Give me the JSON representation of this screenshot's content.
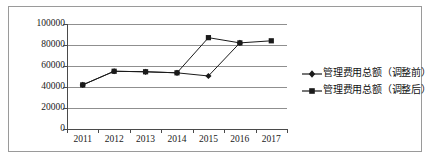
{
  "chart_data": {
    "type": "line",
    "title": "",
    "xlabel": "",
    "ylabel": "",
    "categories": [
      "2011",
      "2012",
      "2013",
      "2014",
      "2015",
      "2016",
      "2017"
    ],
    "ylim": [
      0,
      100000
    ],
    "ytick_labels": [
      "0",
      "20000",
      "40000",
      "60000",
      "80000",
      "100000"
    ],
    "ytick_values": [
      0,
      20000,
      40000,
      60000,
      80000,
      100000
    ],
    "grid": true,
    "legend_position": "right",
    "series": [
      {
        "name": "管理费用总额（调整前）",
        "marker": "diamond",
        "color": "#1a1a1a",
        "x": [
          "2011",
          "2012",
          "2013",
          "2014",
          "2015",
          "2016"
        ],
        "values": [
          42000,
          55000,
          54500,
          53500,
          50500,
          82000
        ]
      },
      {
        "name": "管理费用总额（调整后）",
        "marker": "square",
        "color": "#1a1a1a",
        "x": [
          "2011",
          "2012",
          "2013",
          "2014",
          "2015",
          "2016",
          "2017"
        ],
        "values": [
          42000,
          55000,
          54500,
          53500,
          87000,
          82000,
          84000
        ]
      }
    ]
  },
  "legend": {
    "items": [
      {
        "label": "管理费用总额（调整前）",
        "marker": "diamond-marker"
      },
      {
        "label": "管理费用总额（调整后）",
        "marker": "square-marker"
      }
    ]
  }
}
